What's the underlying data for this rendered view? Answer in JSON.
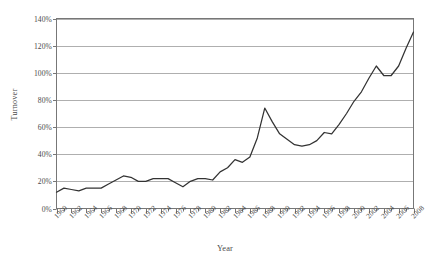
{
  "chart_data": {
    "type": "line",
    "title": "",
    "xlabel": "Year",
    "ylabel": "Turnover",
    "xlim": [
      1960,
      2008
    ],
    "ylim": [
      0,
      140
    ],
    "grid": "horizontal",
    "legend": "none",
    "y_tick_labels": [
      "0%",
      "20%",
      "40%",
      "60%",
      "80%",
      "100%",
      "120%",
      "140%"
    ],
    "y_tick_values": [
      0,
      20,
      40,
      60,
      80,
      100,
      120,
      140
    ],
    "x_tick_labels": [
      "1960",
      "1962",
      "1964",
      "1966",
      "1968",
      "1970",
      "1972",
      "1974",
      "1976",
      "1978",
      "1980",
      "1982",
      "1984",
      "1986",
      "1988",
      "1990",
      "1992",
      "1994",
      "1996",
      "1998",
      "2000",
      "2002",
      "2004",
      "2006",
      "2008"
    ],
    "x_tick_values": [
      1960,
      1962,
      1964,
      1966,
      1968,
      1970,
      1972,
      1974,
      1976,
      1978,
      1980,
      1982,
      1984,
      1986,
      1988,
      1990,
      1992,
      1994,
      1996,
      1998,
      2000,
      2002,
      2004,
      2006,
      2008
    ],
    "minor_tick_interval": 1,
    "line_color": "#333333",
    "series": [
      {
        "name": "Turnover",
        "x": [
          1960,
          1961,
          1962,
          1963,
          1964,
          1965,
          1966,
          1967,
          1968,
          1969,
          1970,
          1971,
          1972,
          1973,
          1974,
          1975,
          1976,
          1977,
          1978,
          1979,
          1980,
          1981,
          1982,
          1983,
          1984,
          1985,
          1986,
          1987,
          1988,
          1989,
          1990,
          1991,
          1992,
          1993,
          1994,
          1995,
          1996,
          1997,
          1998,
          1999,
          2000,
          2001,
          2002,
          2003,
          2004,
          2005,
          2006,
          2007,
          2008
        ],
        "values": [
          12,
          15,
          14,
          13,
          15,
          15,
          15,
          18,
          21,
          24,
          23,
          20,
          20,
          22,
          22,
          22,
          19,
          16,
          20,
          22,
          22,
          21,
          27,
          30,
          36,
          34,
          38,
          52,
          74,
          64,
          55,
          51,
          47,
          46,
          47,
          50,
          56,
          55,
          62,
          70,
          79,
          86,
          96,
          105,
          98,
          98,
          105,
          118,
          130
        ]
      }
    ]
  }
}
